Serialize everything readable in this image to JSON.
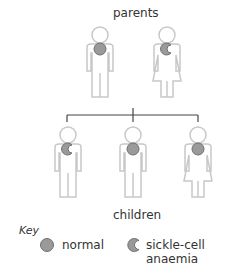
{
  "diagram": {
    "title_top": "parents",
    "title_bottom": "children",
    "colors": {
      "outline": "#c8c8c8",
      "fill": "#ffffff",
      "cell_fill": "#9a9a9a",
      "cell_stroke": "#707070",
      "line": "#444444"
    },
    "parents": [
      {
        "sex": "male",
        "cell": "normal"
      },
      {
        "sex": "female",
        "cell": "sickle-cell anaemia"
      }
    ],
    "children": [
      {
        "sex": "male",
        "cell": "sickle-cell anaemia"
      },
      {
        "sex": "male",
        "cell": "normal"
      },
      {
        "sex": "female",
        "cell": "normal"
      }
    ],
    "key": {
      "title": "Key",
      "items": [
        {
          "icon": "normal-cell-icon",
          "label": "normal"
        },
        {
          "icon": "sickle-cell-icon",
          "label": "sickle-cell anaemia"
        }
      ]
    }
  }
}
